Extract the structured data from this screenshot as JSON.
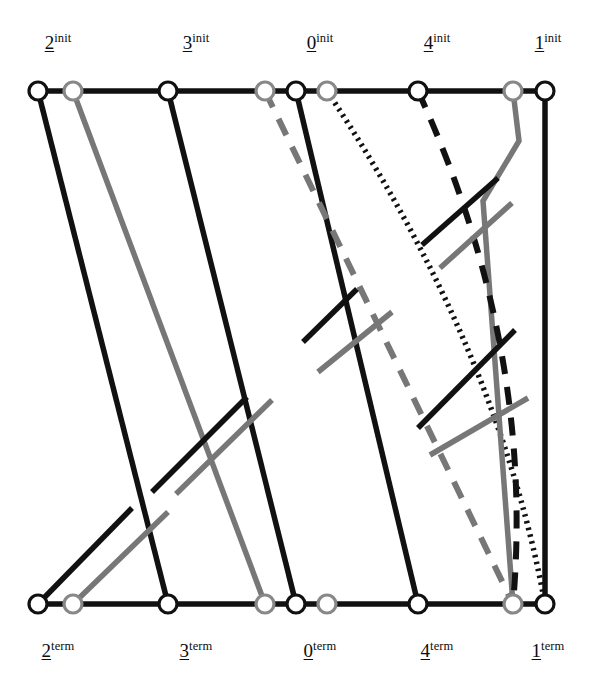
{
  "figure": {
    "type": "braid-diagram",
    "width": 615,
    "height": 692,
    "background": "#ffffff"
  },
  "colors": {
    "black": "#111111",
    "gray": "#777777",
    "node_stroke": "#111111",
    "node_fill": "#ffffff",
    "node_stroke_gray": "#888888"
  },
  "labels": {
    "top": [
      {
        "digit": "2",
        "sup": "init",
        "x": 58,
        "y": 32
      },
      {
        "digit": "3",
        "sup": "init",
        "x": 196,
        "y": 32
      },
      {
        "digit": "0",
        "sup": "init",
        "x": 320,
        "y": 32
      },
      {
        "digit": "4",
        "sup": "init",
        "x": 437,
        "y": 32
      },
      {
        "digit": "1",
        "sup": "init",
        "x": 548,
        "y": 32
      }
    ],
    "bottom": [
      {
        "digit": "2",
        "sup": "term",
        "x": 58,
        "y": 640
      },
      {
        "digit": "3",
        "sup": "term",
        "x": 196,
        "y": 640
      },
      {
        "digit": "0",
        "sup": "term",
        "x": 320,
        "y": 640
      },
      {
        "digit": "4",
        "sup": "term",
        "x": 437,
        "y": 640
      },
      {
        "digit": "1",
        "sup": "term",
        "x": 548,
        "y": 640
      }
    ]
  },
  "nodes": {
    "top_y": 91,
    "bottom_y": 604,
    "radius": 9,
    "top": [
      {
        "id": "t0",
        "x": 38,
        "color": "black"
      },
      {
        "id": "t1",
        "x": 73,
        "color": "gray"
      },
      {
        "id": "t2",
        "x": 168,
        "color": "black"
      },
      {
        "id": "t3",
        "x": 265,
        "color": "gray"
      },
      {
        "id": "t4",
        "x": 296,
        "color": "black"
      },
      {
        "id": "t5",
        "x": 327,
        "color": "gray"
      },
      {
        "id": "t6",
        "x": 418,
        "color": "black"
      },
      {
        "id": "t7",
        "x": 513,
        "color": "gray"
      },
      {
        "id": "t8",
        "x": 545,
        "color": "black"
      }
    ],
    "bottom": [
      {
        "id": "b0",
        "x": 38,
        "color": "black"
      },
      {
        "id": "b1",
        "x": 73,
        "color": "gray"
      },
      {
        "id": "b2",
        "x": 168,
        "color": "black"
      },
      {
        "id": "b3",
        "x": 265,
        "color": "gray"
      },
      {
        "id": "b4",
        "x": 296,
        "color": "black"
      },
      {
        "id": "b5",
        "x": 327,
        "color": "gray"
      },
      {
        "id": "b6",
        "x": 418,
        "color": "black"
      },
      {
        "id": "b7",
        "x": 513,
        "color": "gray"
      },
      {
        "id": "b8",
        "x": 545,
        "color": "black"
      }
    ]
  },
  "strand_styles": {
    "solid_black": {
      "color": "#111111",
      "width": 5.5,
      "dash": "none"
    },
    "solid_gray": {
      "color": "#777777",
      "width": 5.5,
      "dash": "none"
    },
    "dashed_black": {
      "color": "#111111",
      "width": 6,
      "dash": "18 13"
    },
    "dashed_gray": {
      "color": "#777777",
      "width": 6,
      "dash": "18 13"
    },
    "dotted_black": {
      "color": "#111111",
      "width": 5.5,
      "dash": "2.5 4.5"
    }
  },
  "strands": [
    {
      "name": "strand-black-solid-2",
      "style": "solid_black",
      "from": "t0",
      "to": "b2"
    },
    {
      "name": "strand-gray-solid-2",
      "style": "solid_gray",
      "from": "t1",
      "to": "b3"
    },
    {
      "name": "strand-black-solid-3",
      "style": "solid_black",
      "from": "t2",
      "to": "b4"
    },
    {
      "name": "strand-black-solid-0",
      "style": "solid_black",
      "from": "t4",
      "to": "b6"
    },
    {
      "name": "strand-gray-dashed-0",
      "style": "dashed_gray",
      "from": "t3",
      "to": "b7"
    },
    {
      "name": "strand-dotted-0",
      "style": "dotted_black",
      "from": "t5",
      "to": "b8"
    },
    {
      "name": "strand-black-solid-1",
      "style": "solid_black",
      "from": "t8",
      "to": "b8"
    },
    {
      "name": "strand-gray-solid-1",
      "style": "solid_gray",
      "from": "t7",
      "to": "b7"
    },
    {
      "name": "strand-black-dashed-4",
      "style": "dashed_black",
      "from": "t6",
      "to": "b7"
    }
  ],
  "crossing_segments": {
    "note": "short diagonal over-strand segments drawn across the descending strands",
    "items": [
      {
        "name": "cross-black-1",
        "style": "solid_black",
        "x1": 38,
        "y1": 604,
        "x2": 132,
        "y2": 508
      },
      {
        "name": "cross-gray-1",
        "style": "solid_gray",
        "x1": 73,
        "y1": 604,
        "x2": 168,
        "y2": 512
      },
      {
        "name": "cross-black-2",
        "style": "solid_black",
        "x1": 152,
        "y1": 492,
        "x2": 247,
        "y2": 397
      },
      {
        "name": "cross-gray-2",
        "style": "solid_gray",
        "x1": 176,
        "y1": 494,
        "x2": 272,
        "y2": 400
      },
      {
        "name": "cross-black-3",
        "style": "solid_black",
        "x1": 303,
        "y1": 342,
        "x2": 357,
        "y2": 289
      },
      {
        "name": "cross-gray-3",
        "style": "solid_gray",
        "x1": 318,
        "y1": 372,
        "x2": 392,
        "y2": 312
      },
      {
        "name": "cross-black-4",
        "style": "solid_black",
        "x1": 422,
        "y1": 245,
        "x2": 498,
        "y2": 178
      },
      {
        "name": "cross-gray-4",
        "style": "solid_gray",
        "x1": 440,
        "y1": 268,
        "x2": 512,
        "y2": 203
      },
      {
        "name": "cross-black-5",
        "style": "solid_black",
        "x1": 418,
        "y1": 428,
        "x2": 515,
        "y2": 330
      },
      {
        "name": "cross-gray-5",
        "style": "solid_gray",
        "x1": 430,
        "y1": 455,
        "x2": 528,
        "y2": 398
      }
    ]
  },
  "accessibility": {
    "title": "Braid diagram with five initial and five terminal endpoints",
    "description": "Nine strand curves connect nine circular nodes on the top row to nine circular nodes on the bottom row, drawn in black and gray with solid, dashed and dotted line styles."
  }
}
